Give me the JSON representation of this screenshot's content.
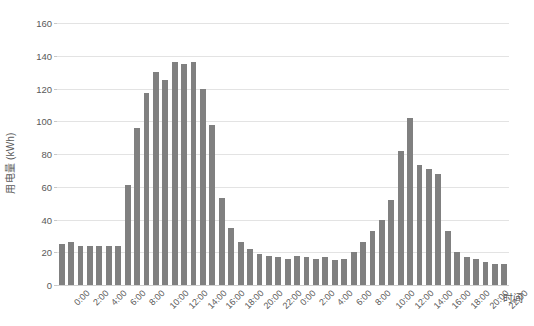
{
  "chart_data": {
    "type": "bar",
    "title": "",
    "xlabel": "时间",
    "ylabel": "用电量 (kWh)",
    "ylim": [
      0,
      160
    ],
    "yticks": [
      0,
      20,
      40,
      60,
      80,
      100,
      120,
      140,
      160
    ],
    "grid": true,
    "legend": "none",
    "bar_color": "#808080",
    "background_color": "#ffffff",
    "gridline_color": "#e3e3e3",
    "text_color": "#595959",
    "categories": [
      "0:00",
      "1:00",
      "2:00",
      "3:00",
      "4:00",
      "5:00",
      "6:00",
      "7:00",
      "8:00",
      "9:00",
      "10:00",
      "11:00",
      "12:00",
      "13:00",
      "14:00",
      "15:00",
      "16:00",
      "17:00",
      "18:00",
      "19:00",
      "20:00",
      "21:00",
      "22:00",
      "23:00",
      "0:00",
      "1:00",
      "2:00",
      "3:00",
      "4:00",
      "5:00",
      "6:00",
      "7:00",
      "8:00",
      "9:00",
      "10:00",
      "11:00",
      "12:00",
      "13:00",
      "14:00",
      "15:00",
      "16:00",
      "17:00",
      "18:00",
      "19:00",
      "20:00",
      "21:00",
      "22:00",
      "23:00"
    ],
    "tick_labels": [
      "0:00",
      "",
      "2:00",
      "",
      "4:00",
      "",
      "6:00",
      "",
      "8:00",
      "",
      "10:00",
      "",
      "12:00",
      "",
      "14:00",
      "",
      "16:00",
      "",
      "18:00",
      "",
      "20:00",
      "",
      "22:00",
      "",
      "0:00",
      "",
      "2:00",
      "",
      "4:00",
      "",
      "6:00",
      "",
      "8:00",
      "",
      "10:00",
      "",
      "12:00",
      "",
      "14:00",
      "",
      "16:00",
      "",
      "18:00",
      "",
      "20:00",
      "",
      "22:00",
      ""
    ],
    "values": [
      25,
      26,
      24,
      24,
      24,
      24,
      24,
      61,
      96,
      117,
      130,
      125,
      136,
      135,
      136,
      120,
      98,
      53,
      35,
      26,
      22,
      19,
      18,
      17,
      16,
      18,
      17,
      16,
      17,
      15,
      16,
      20,
      26,
      33,
      40,
      52,
      82,
      102,
      73,
      71,
      68,
      33,
      20,
      17,
      16,
      14,
      13,
      13
    ],
    "units": "kWh"
  }
}
